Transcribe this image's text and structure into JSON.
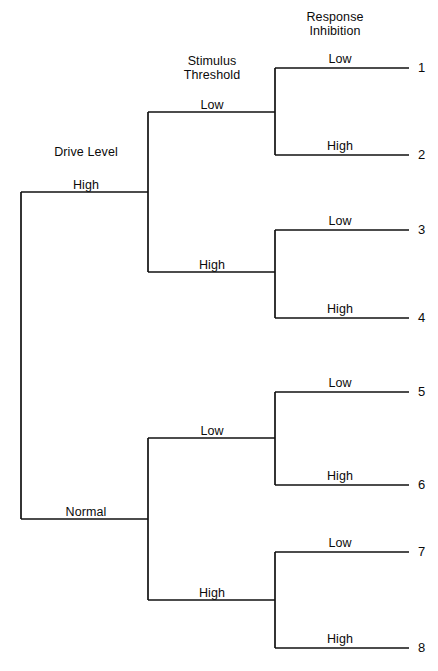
{
  "figure": {
    "type": "tree-diagram",
    "title": "",
    "width": 438,
    "height": 671,
    "background": "#ffffff",
    "line_color": "#111111"
  },
  "headers": [
    {
      "id": "drive-level",
      "text": "Drive Level",
      "x": 86,
      "y": 152
    },
    {
      "id": "stimulus-threshold",
      "line1": "Stimulus",
      "line2": "Threshold",
      "x": 212,
      "y": 68
    },
    {
      "id": "response-inhibition",
      "line1": "Response",
      "line2": "Inhibition",
      "x": 335,
      "y": 24
    }
  ],
  "branch_labels": [
    {
      "id": "drive-high",
      "text": "High",
      "x": 86,
      "y": 185
    },
    {
      "id": "drive-normal",
      "text": "Normal",
      "x": 86,
      "y": 512
    },
    {
      "id": "st-low-upper",
      "text": "Low",
      "x": 212,
      "y": 105
    },
    {
      "id": "st-high-upper",
      "text": "High",
      "x": 212,
      "y": 265
    },
    {
      "id": "st-low-lower",
      "text": "Low",
      "x": 212,
      "y": 431
    },
    {
      "id": "st-high-lower",
      "text": "High",
      "x": 212,
      "y": 593
    },
    {
      "id": "ri-low-1",
      "text": "Low",
      "x": 340,
      "y": 59
    },
    {
      "id": "ri-high-2",
      "text": "High",
      "x": 340,
      "y": 146
    },
    {
      "id": "ri-low-3",
      "text": "Low",
      "x": 340,
      "y": 221
    },
    {
      "id": "ri-high-4",
      "text": "High",
      "x": 340,
      "y": 309
    },
    {
      "id": "ri-low-5",
      "text": "Low",
      "x": 340,
      "y": 383
    },
    {
      "id": "ri-high-6",
      "text": "High",
      "x": 340,
      "y": 476
    },
    {
      "id": "ri-low-7",
      "text": "Low",
      "x": 340,
      "y": 543
    },
    {
      "id": "ri-high-8",
      "text": "High",
      "x": 340,
      "y": 639
    }
  ],
  "leaves": [
    {
      "id": "leaf-1",
      "number": "1",
      "x": 418,
      "y": 68,
      "drive_level": "High",
      "stimulus_threshold": "Low",
      "response_inhibition": "Low"
    },
    {
      "id": "leaf-2",
      "number": "2",
      "x": 418,
      "y": 155,
      "drive_level": "High",
      "stimulus_threshold": "Low",
      "response_inhibition": "High"
    },
    {
      "id": "leaf-3",
      "number": "3",
      "x": 418,
      "y": 230,
      "drive_level": "High",
      "stimulus_threshold": "High",
      "response_inhibition": "Low"
    },
    {
      "id": "leaf-4",
      "number": "4",
      "x": 418,
      "y": 318,
      "drive_level": "High",
      "stimulus_threshold": "High",
      "response_inhibition": "High"
    },
    {
      "id": "leaf-5",
      "number": "5",
      "x": 418,
      "y": 392,
      "drive_level": "Normal",
      "stimulus_threshold": "Low",
      "response_inhibition": "Low"
    },
    {
      "id": "leaf-6",
      "number": "6",
      "x": 418,
      "y": 485,
      "drive_level": "Normal",
      "stimulus_threshold": "Low",
      "response_inhibition": "High"
    },
    {
      "id": "leaf-7",
      "number": "7",
      "x": 418,
      "y": 552,
      "drive_level": "Normal",
      "stimulus_threshold": "High",
      "response_inhibition": "Low"
    },
    {
      "id": "leaf-8",
      "number": "8",
      "x": 418,
      "y": 648,
      "drive_level": "Normal",
      "stimulus_threshold": "High",
      "response_inhibition": "High"
    }
  ],
  "geometry": {
    "root_x": 21,
    "level2_x": 148,
    "level3_x": 275,
    "leaf_end_x": 409,
    "root_top_y": 192,
    "root_bottom_y": 519,
    "branches": [
      {
        "id": "b-high",
        "x": 148,
        "top": 112,
        "bottom": 272,
        "in_y": 192
      },
      {
        "id": "b-normal",
        "x": 148,
        "top": 438,
        "bottom": 600,
        "in_y": 519
      }
    ],
    "forks": [
      {
        "id": "f1",
        "x": 275,
        "top": 68,
        "bottom": 155,
        "in_y": 112
      },
      {
        "id": "f2",
        "x": 275,
        "top": 230,
        "bottom": 318,
        "in_y": 272
      },
      {
        "id": "f3",
        "x": 275,
        "top": 392,
        "bottom": 485,
        "in_y": 438
      },
      {
        "id": "f4",
        "x": 275,
        "top": 552,
        "bottom": 648,
        "in_y": 600
      }
    ]
  }
}
